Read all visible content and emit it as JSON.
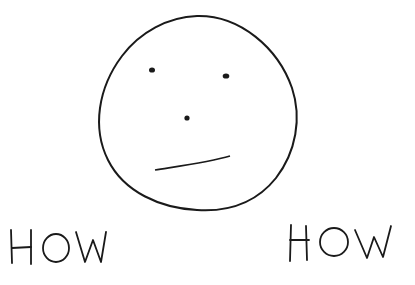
{
  "drawing": {
    "subject": "hand-drawn neutral face",
    "stroke_color": "#1a1a1a",
    "background": "#ffffff"
  },
  "labels": {
    "left": "HOW",
    "right": "HOW"
  },
  "caption": {
    "text": ""
  }
}
